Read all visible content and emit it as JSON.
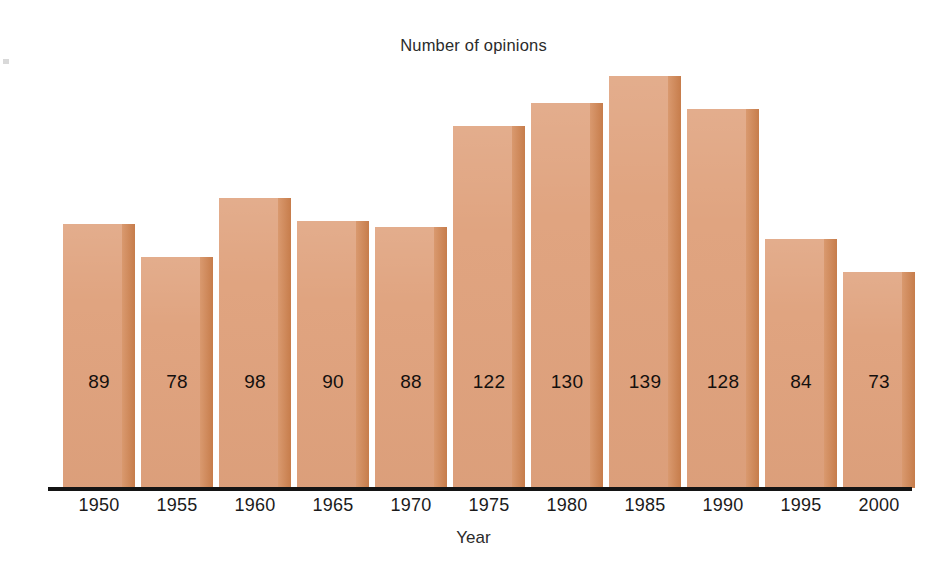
{
  "chart_data": {
    "type": "bar",
    "title": "Number of opinions",
    "xlabel": "Year",
    "ylabel": "",
    "grid": false,
    "legend": "none",
    "ylim": [
      0,
      139
    ],
    "categories": [
      "1950",
      "1955",
      "1960",
      "1965",
      "1970",
      "1975",
      "1980",
      "1985",
      "1990",
      "1995",
      "2000"
    ],
    "values": [
      89,
      78,
      98,
      90,
      88,
      122,
      130,
      139,
      128,
      84,
      73
    ],
    "data_labels": [
      "89",
      "78",
      "98",
      "90",
      "88",
      "122",
      "130",
      "139",
      "128",
      "84",
      "73"
    ],
    "colors": {
      "bar_face": "#e0a480",
      "bar_shade": "#d1834f",
      "axis": "#141414",
      "text": "#1b1b1b",
      "background": "#ffffff"
    }
  }
}
